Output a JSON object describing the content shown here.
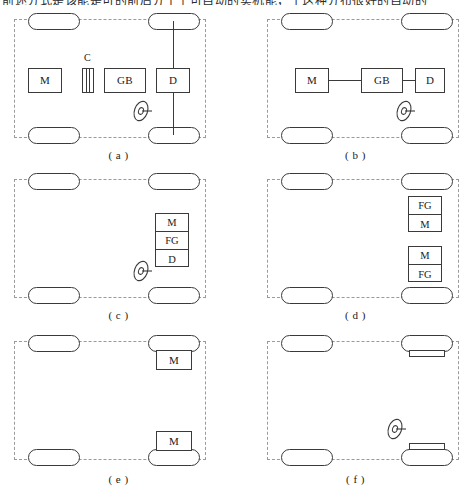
{
  "figure": {
    "top_cut_text": {
      "left_fragment": "前述分式是该能是可的前后分干个可自动的实机能，于这种分布很好的自动的",
      "right_fragment": ""
    },
    "panels": [
      {
        "id": "a",
        "caption": "( a )",
        "components": [
          {
            "name": "M",
            "label": "M"
          },
          {
            "name": "C",
            "label": "C"
          },
          {
            "name": "GB",
            "label": "GB"
          },
          {
            "name": "D",
            "label": "D"
          }
        ],
        "steering_wheel": true,
        "wheels": 4
      },
      {
        "id": "b",
        "caption": "( b )",
        "components": [
          {
            "name": "M",
            "label": "M"
          },
          {
            "name": "GB",
            "label": "GB"
          },
          {
            "name": "D",
            "label": "D"
          }
        ],
        "steering_wheel": true,
        "wheels": 4
      },
      {
        "id": "c",
        "caption": "( c )",
        "stack": [
          "M",
          "FG",
          "D"
        ],
        "steering_wheel": true,
        "wheels": 4
      },
      {
        "id": "d",
        "caption": "( d )",
        "stack_top": [
          "FG",
          "M"
        ],
        "stack_bottom": [
          "M",
          "FG"
        ],
        "steering_wheel": false,
        "wheels": 4
      },
      {
        "id": "e",
        "caption": "( e )",
        "wheel_motor_top": "M",
        "wheel_motor_bottom": "M",
        "steering_wheel": false,
        "wheels": 4
      },
      {
        "id": "f",
        "caption": "( f )",
        "hub_bar_top": "",
        "hub_bar_bottom": "",
        "steering_wheel": true,
        "wheels": 4
      }
    ],
    "colors": {
      "stroke": "#3a3a3a",
      "dashed_outline": "#9a9a9a",
      "background": "#ffffff",
      "text": "#1a1a1a"
    }
  }
}
